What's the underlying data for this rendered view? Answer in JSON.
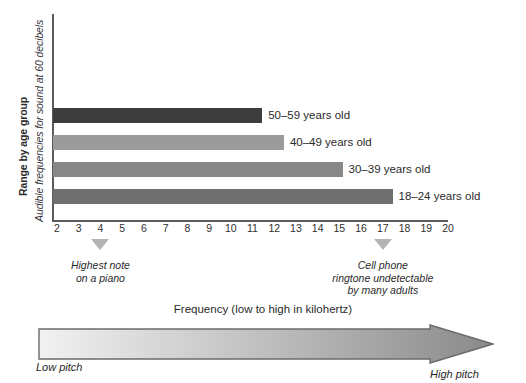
{
  "chart_data": {
    "type": "bar",
    "orientation": "horizontal",
    "title_bold": "Range by age group",
    "title_italic": "Audible frequencies for sound at 60 decibels",
    "xlabel": "Frequency (low to high in kilohertz)",
    "ylabel": "",
    "xlim": [
      2,
      20
    ],
    "xticks": [
      2,
      3,
      4,
      5,
      6,
      7,
      8,
      9,
      10,
      11,
      12,
      13,
      14,
      15,
      16,
      17,
      18,
      19,
      20
    ],
    "grid": false,
    "legend": "none",
    "units": "kilohertz",
    "categories": [
      "50–59 years old",
      "40–49 years old",
      "30–39 years old",
      "18–24 years old"
    ],
    "values": [
      11.4,
      12.4,
      15.1,
      17.4
    ],
    "bar_start": 2,
    "bars": [
      {
        "label": "50–59 years old",
        "value": 11.4,
        "color": "#3d3d3d"
      },
      {
        "label": "40–49 years old",
        "value": 12.4,
        "color": "#9b9b9b"
      },
      {
        "label": "30–39 years old",
        "value": 15.1,
        "color": "#878787"
      },
      {
        "label": "18–24 years old",
        "value": 17.4,
        "color": "#6f6f6f"
      }
    ],
    "annotations": [
      {
        "x": 4,
        "lines": [
          "Highest note",
          "on a piano"
        ]
      },
      {
        "x": 17,
        "lines": [
          "Cell phone",
          "ringtone undetectable",
          "by many adults"
        ]
      }
    ],
    "pitch_scale": {
      "caption": "Frequency (low to high in kilohertz)",
      "low_label": "Low pitch",
      "high_label": "High pitch",
      "gradient_from": "#f2f2f2",
      "gradient_to": "#8a8a8a"
    },
    "colors": {
      "axis": "#5b5b5b",
      "marker": "#b4b4b4",
      "text": "#2b2b2b"
    }
  }
}
